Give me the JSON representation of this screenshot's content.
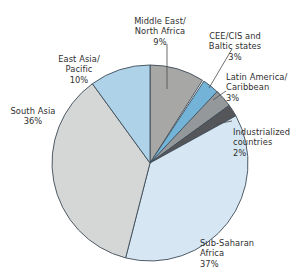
{
  "chart_data": {
    "type": "pie",
    "title": "",
    "subtitle": "",
    "xlabel": "",
    "ylabel": "",
    "legend_position": "none",
    "grid": false,
    "units": "percent",
    "start_angle_deg": -90,
    "direction": "clockwise",
    "categories": [
      "Middle East/\nNorth Africa",
      "CEE/CIS and\nBaltic states",
      "Latin America/\nCaribbean",
      "Industrialized\ncountries",
      "Sub-Saharan\nAfrica",
      "South Asia",
      "East Asia/\nPacific"
    ],
    "values": [
      9,
      3,
      3,
      2,
      37,
      36,
      10
    ],
    "slices": [
      {
        "label": "Middle East/\nNorth Africa",
        "value": 9,
        "pct_text": "9%",
        "color": "#a7a8a6"
      },
      {
        "label": "CEE/CIS and\nBaltic states",
        "value": 3,
        "pct_text": "3%",
        "color": "#74b3d8"
      },
      {
        "label": "Latin America/\nCaribbean",
        "value": 3,
        "pct_text": "3%",
        "color": "#95989a"
      },
      {
        "label": "Industrialized\ncountries",
        "value": 2,
        "pct_text": "2%",
        "color": "#55565a"
      },
      {
        "label": "Sub-Saharan\nAfrica",
        "value": 37,
        "pct_text": "37%",
        "color": "#d6e7f3"
      },
      {
        "label": "South Asia",
        "value": 36,
        "pct_text": "36%",
        "color": "#d4d7d5"
      },
      {
        "label": "East Asia/\nPacific",
        "value": 10,
        "pct_text": "10%",
        "color": "#aed3e8"
      }
    ]
  },
  "labels": {
    "mena": {
      "text": "Middle East/\nNorth Africa",
      "pct": "9%"
    },
    "cee": {
      "text": "CEE/CIS and\nBaltic states",
      "pct": "3%"
    },
    "latam": {
      "text": "Latin America/\nCaribbean",
      "pct": "3%"
    },
    "industrial": {
      "text": "Industrialized\ncountries",
      "pct": "2%"
    },
    "eap": {
      "text": "East Asia/\nPacific",
      "pct": "10%"
    },
    "southasia": {
      "text": "South Asia",
      "pct": "36%"
    },
    "ssa": {
      "text": "Sub-Saharan\nAfrica",
      "pct": "37%"
    }
  },
  "colors": {
    "mena": "#a7a8a6",
    "cee": "#74b3d8",
    "latam": "#95989a",
    "industrial": "#55565a",
    "eap": "#aed3e8",
    "southasia": "#d4d7d5",
    "ssa": "#d6e7f3",
    "outline": "#3d4b57",
    "leader": "#4a4a4a",
    "text": "#2f2f2f"
  }
}
